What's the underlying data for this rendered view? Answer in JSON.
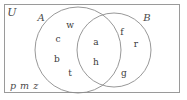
{
  "diagram": {
    "type": "venn",
    "title_label": "U",
    "universe": {
      "name": "U",
      "label": "U",
      "border_color": "#9a9a9a",
      "fill_color": "#ffffff"
    },
    "sets": [
      {
        "id": "A",
        "label": "A",
        "label_x": 41,
        "label_y": 18,
        "cx": 78,
        "cy": 50,
        "r": 43,
        "stroke": "#8c8c8c"
      },
      {
        "id": "B",
        "label": "B",
        "label_x": 147,
        "label_y": 18,
        "cx": 114,
        "cy": 50,
        "r": 37,
        "stroke": "#8c8c8c"
      }
    ],
    "regions": {
      "a_only": {
        "name": "A only",
        "members": [
          {
            "text": "w",
            "x": 70,
            "y": 25
          },
          {
            "text": "c",
            "x": 58,
            "y": 39
          },
          {
            "text": "b",
            "x": 57,
            "y": 59
          },
          {
            "text": "t",
            "x": 70,
            "y": 73
          }
        ]
      },
      "intersection": {
        "name": "A intersect B",
        "members": [
          {
            "text": "a",
            "x": 96,
            "y": 42
          },
          {
            "text": "h",
            "x": 96,
            "y": 62
          }
        ]
      },
      "b_only": {
        "name": "B only",
        "members": [
          {
            "text": "f",
            "x": 122,
            "y": 32
          },
          {
            "text": "r",
            "x": 136,
            "y": 44
          },
          {
            "text": "g",
            "x": 124,
            "y": 73
          }
        ]
      },
      "outside": {
        "name": "Outside both sets",
        "text": "p m z",
        "x": 10,
        "y": 86
      }
    },
    "frame": {
      "x": 4,
      "y": 4,
      "width": 176,
      "height": 89
    }
  }
}
